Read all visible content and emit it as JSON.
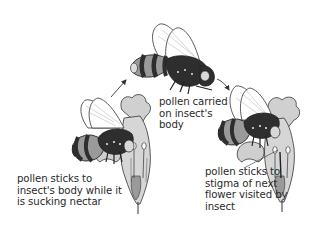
{
  "diagram": {
    "stages": [
      {
        "id": "stage-1",
        "caption": "pollen sticks to\ninsect's body while it\nis sucking nectar"
      },
      {
        "id": "stage-2",
        "caption": "pollen carried\non insect's\nbody"
      },
      {
        "id": "stage-3",
        "caption": "pollen sticks to\nstigma of next\nflower visited by\ninsect"
      }
    ],
    "arrows": [
      {
        "from": "stage-1",
        "to": "stage-2"
      },
      {
        "from": "stage-2",
        "to": "stage-3"
      }
    ],
    "colors": {
      "outline": "#222222",
      "dark_band": "#2e2e2e",
      "mid_band": "#9a9a9a",
      "petal": "#d2d2d2",
      "wing": "#ffffff",
      "pollen": "#e8e8e8",
      "text": "#2a2a2a",
      "background": "#ffffff"
    }
  }
}
